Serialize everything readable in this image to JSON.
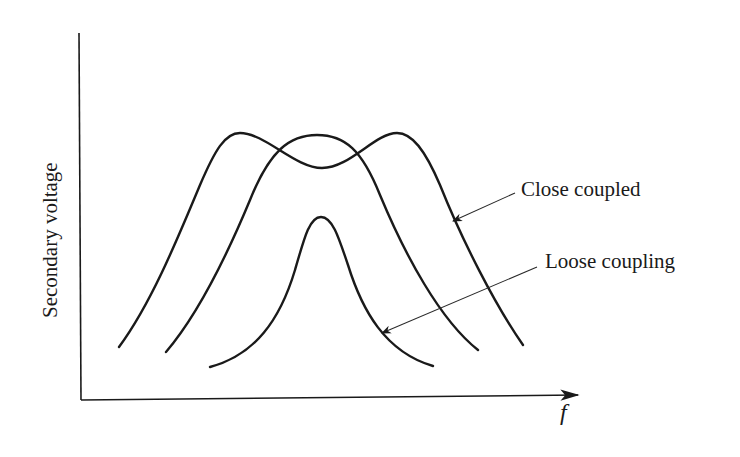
{
  "diagram": {
    "y_axis_label": "Secondary voltage",
    "x_axis_label": "f",
    "annotations": [
      {
        "id": "close",
        "text": "Close coupled"
      },
      {
        "id": "loose",
        "text": "Loose coupling"
      }
    ],
    "curves": [
      {
        "name": "close-coupled",
        "shape": "double-hump",
        "description": "Overcoupled response with two peaks and a central dip"
      },
      {
        "name": "critical-coupling",
        "shape": "single-broad-peak",
        "description": "Broad single peak centered at resonance"
      },
      {
        "name": "loose-coupling",
        "shape": "single-narrow-peak",
        "description": "Narrow, lower peak centered at resonance"
      }
    ],
    "colors": {
      "ink": "#1a1a1a",
      "background": "#ffffff"
    }
  }
}
